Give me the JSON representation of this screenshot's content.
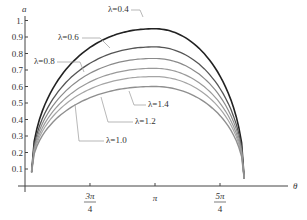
{
  "chart_data": {
    "type": "line",
    "title": "",
    "xlabel": "θ",
    "ylabel": "a",
    "x_ticks": [
      {
        "label_num": "3π",
        "label_den": "4",
        "value": 2.356
      },
      {
        "label_num": "π",
        "label_den": "",
        "value": 3.1416
      },
      {
        "label_num": "5π",
        "label_den": "4",
        "value": 3.927
      }
    ],
    "y_ticks": [
      "0.1",
      "0.2",
      "0.3",
      "0.4",
      "0.5",
      "0.6",
      "0.7",
      "0.8",
      "0.9",
      "1."
    ],
    "ylim": [
      0,
      1.0
    ],
    "xlim": [
      1.55,
      4.45
    ],
    "grid": false,
    "legend": "inline leader-line labels",
    "x_start": 1.65,
    "x_end": 4.22,
    "start_value": 0.08,
    "end_value": 0.04,
    "series": [
      {
        "name": "λ=0.4",
        "peak": 0.95,
        "color": "#222222",
        "width": 1.6
      },
      {
        "name": "λ=0.6",
        "peak": 0.84,
        "color": "#555555",
        "width": 1.3
      },
      {
        "name": "λ=0.8",
        "peak": 0.77,
        "color": "#8a8a8a",
        "width": 1.2
      },
      {
        "name": "λ=1.0",
        "peak": 0.71,
        "color": "#9a9a9a",
        "width": 1.2
      },
      {
        "name": "λ=1.2",
        "peak": 0.66,
        "color": "#a5a5a5",
        "width": 1.2
      },
      {
        "name": "λ=1.4",
        "peak": 0.6,
        "color": "#8f8f8f",
        "width": 1.4
      }
    ],
    "annotations": [
      {
        "text": "λ=0.4",
        "x": 108,
        "y": 12,
        "lead": [
          [
            131,
            10
          ],
          [
            140,
            10
          ],
          [
            143,
            17
          ]
        ]
      },
      {
        "text": "λ=0.6",
        "x": 58,
        "y": 40,
        "lead": [
          [
            82,
            38
          ],
          [
            100,
            38
          ],
          [
            110,
            48
          ]
        ]
      },
      {
        "text": "λ=0.8",
        "x": 34,
        "y": 64,
        "lead": [
          [
            57,
            62
          ],
          [
            80,
            62
          ],
          [
            84,
            72
          ]
        ]
      },
      {
        "text": "λ=1.4",
        "x": 148,
        "y": 107,
        "lead": [
          [
            146,
            105
          ],
          [
            134,
            105
          ],
          [
            129,
            91
          ]
        ]
      },
      {
        "text": "λ=1.2",
        "x": 135,
        "y": 124,
        "lead": [
          [
            133,
            122
          ],
          [
            108,
            122
          ],
          [
            101,
            97
          ]
        ]
      },
      {
        "text": "λ=1.0",
        "x": 106,
        "y": 143,
        "lead": [
          [
            104,
            141
          ],
          [
            79,
            141
          ],
          [
            75,
            104
          ]
        ]
      }
    ]
  }
}
